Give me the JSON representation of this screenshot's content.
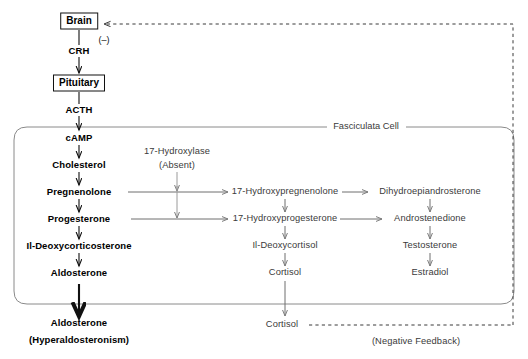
{
  "diagram": {
    "colors": {
      "ink": "#000000",
      "gray_text": "#3a3a3a",
      "gray_line": "#7d7d7d",
      "box_border": "#8a8a8a",
      "dashed": "#6b6b6b"
    }
  },
  "axis_nodes": {
    "brain": "Brain",
    "crh": "CRH",
    "pituitary": "Pituitary",
    "acth": "ACTH",
    "negative_sign": "(–)"
  },
  "cell": {
    "label": "Fasciculata Cell"
  },
  "enzyme": {
    "name": "17-Hydroxylase",
    "state": "(Absent)"
  },
  "mineralocorticoid_pathway": [
    "cAMP",
    "Cholesterol",
    "Pregnenolone",
    "Progesterone",
    "Il-Deoxycorticosterone",
    "Aldosterone"
  ],
  "glucocorticoid_pathway": [
    "17-Hydroxypregnenolone",
    "17-Hydroxyprogesterone",
    "Il-Deoxycortisol",
    "Cortisol"
  ],
  "androgen_pathway": [
    "Dihydroepiandrosterone",
    "Androstenedione",
    "Testosterone",
    "Estradiol"
  ],
  "outputs": {
    "aldosterone_name": "Aldosterone",
    "aldosterone_note": "(Hyperaldosteronism)",
    "cortisol_name": "Cortisol",
    "feedback_label": "(Negative Feedback)"
  }
}
